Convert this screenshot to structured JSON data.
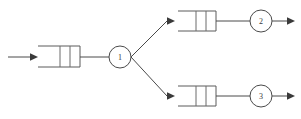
{
  "diagram": {
    "type": "open-queueing-network",
    "title": "",
    "stroke_color": "#4a4a4a",
    "background_color": "#ffffff",
    "nodes": [
      {
        "id": "queue-1",
        "kind": "queue-buffer",
        "label": "",
        "slots": 2,
        "x": 44,
        "y": 46,
        "width": 36,
        "height": 21
      },
      {
        "id": "server-1",
        "kind": "server",
        "label": "1",
        "cx": 120,
        "cy": 57,
        "r": 11
      },
      {
        "id": "queue-2",
        "kind": "queue-buffer",
        "label": "",
        "slots": 2,
        "x": 180,
        "y": 11,
        "width": 36,
        "height": 20
      },
      {
        "id": "server-2",
        "kind": "server",
        "label": "2",
        "cx": 261,
        "cy": 21,
        "r": 11
      },
      {
        "id": "queue-3",
        "kind": "queue-buffer",
        "label": "",
        "slots": 2,
        "x": 180,
        "y": 86,
        "width": 36,
        "height": 20
      },
      {
        "id": "server-3",
        "kind": "server",
        "label": "3",
        "cx": 261,
        "cy": 96,
        "r": 11
      }
    ],
    "arrows": [
      {
        "id": "arrival-arrow",
        "label": "",
        "from_x": 8,
        "from_y": 57,
        "to_x": 34,
        "to_y": 57
      },
      {
        "id": "branch-up-arrow",
        "label": "",
        "from_x": 137,
        "from_y": 57,
        "to_x": 172,
        "to_y": 21
      },
      {
        "id": "branch-down-arrow",
        "label": "",
        "from_x": 137,
        "from_y": 57,
        "to_x": 172,
        "to_y": 96
      },
      {
        "id": "departure-arrow-2",
        "label": "",
        "from_x": 272,
        "from_y": 21,
        "to_x": 295,
        "to_y": 21
      },
      {
        "id": "departure-arrow-3",
        "label": "",
        "from_x": 272,
        "from_y": 96,
        "to_x": 295,
        "to_y": 96
      }
    ],
    "links": [
      {
        "id": "link-queue1-server1",
        "from_x": 80,
        "from_y": 57,
        "to_x": 109,
        "to_y": 57
      },
      {
        "id": "link-queue2-server2",
        "from_x": 216,
        "from_y": 21,
        "to_x": 250,
        "to_y": 21
      },
      {
        "id": "link-queue3-server3",
        "from_x": 216,
        "from_y": 96,
        "to_x": 250,
        "to_y": 96
      }
    ]
  }
}
